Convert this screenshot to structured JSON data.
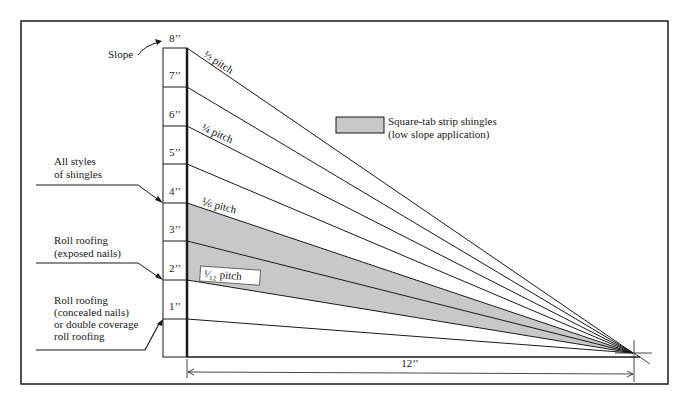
{
  "diagram": {
    "slope_label": "Slope",
    "ticks": [
      "8’’",
      "7’’",
      "6’’",
      "5’’",
      "4’’",
      "3’’",
      "2’’",
      "1’’"
    ],
    "pitch_labels": {
      "third": "⅓ pitch",
      "quarter": "¼ pitch",
      "sixth": "⅙ pitch",
      "twelfth": "¹⁄₁₂ pitch"
    },
    "run_label": "12’’",
    "legend": {
      "line1": "Square-tab strip shingles",
      "line2": "(low slope application)",
      "swatch_color": "#c8c8c8"
    },
    "callouts": {
      "all_styles": [
        "All styles",
        "of shingles"
      ],
      "roll_exposed": [
        "Roll roofing",
        "(exposed nails)"
      ],
      "roll_concealed": [
        "Roll roofing",
        "(concealed nails)",
        "or double coverage",
        "roll roofing"
      ]
    },
    "colors": {
      "line": "#1a1a1a",
      "shade": "#c8c8c8",
      "background": "#ffffff"
    }
  }
}
